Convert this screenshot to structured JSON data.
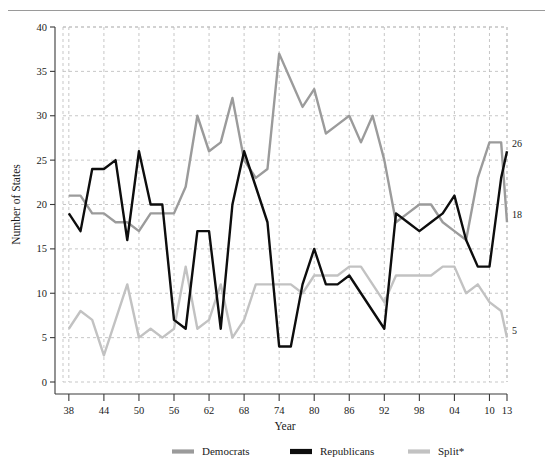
{
  "figure": {
    "has_top_rule": true,
    "background": "#ffffff"
  },
  "chart_data": {
    "type": "line",
    "title": "",
    "xlabel": "Year",
    "ylabel": "Number of States",
    "xlim": [
      37,
      113
    ],
    "ylim": [
      0,
      40
    ],
    "grid": true,
    "legend_position": "bottom",
    "ytick_labels": [
      "0",
      "5",
      "10",
      "15",
      "20",
      "25",
      "30",
      "35",
      "40"
    ],
    "ytick_values": [
      0,
      5,
      10,
      15,
      20,
      25,
      30,
      35,
      40
    ],
    "xtick_labels": [
      "38",
      "44",
      "50",
      "56",
      "62",
      "68",
      "74",
      "80",
      "86",
      "92",
      "98",
      "04",
      "10",
      "13"
    ],
    "xtick_values": [
      38,
      44,
      50,
      56,
      62,
      68,
      74,
      80,
      86,
      92,
      98,
      104,
      110,
      113
    ],
    "x": [
      38,
      40,
      42,
      44,
      46,
      48,
      50,
      52,
      54,
      56,
      58,
      60,
      62,
      64,
      66,
      68,
      70,
      72,
      74,
      76,
      78,
      80,
      82,
      84,
      86,
      88,
      90,
      92,
      94,
      96,
      98,
      100,
      102,
      104,
      106,
      108,
      110,
      112,
      113
    ],
    "series": [
      {
        "name": "Democrats",
        "color": "#9b9b9b",
        "values": [
          21,
          21,
          19,
          19,
          18,
          18,
          17,
          19,
          19,
          19,
          22,
          30,
          26,
          27,
          32,
          25,
          23,
          24,
          37,
          34,
          31,
          33,
          28,
          29,
          30,
          27,
          30,
          25,
          18,
          19,
          20,
          20,
          18,
          17,
          16,
          23,
          27,
          27,
          18
        ],
        "end_label": "18"
      },
      {
        "name": "Republicans",
        "color": "#0d0d0d",
        "values": [
          19,
          17,
          24,
          24,
          25,
          16,
          26,
          20,
          20,
          7,
          6,
          17,
          17,
          6,
          20,
          26,
          22,
          18,
          4,
          4,
          11,
          15,
          11,
          11,
          12,
          10,
          8,
          6,
          19,
          18,
          17,
          18,
          19,
          21,
          16,
          13,
          13,
          23,
          26
        ],
        "end_label": "26"
      },
      {
        "name": "Split*",
        "color": "#c2c2c2",
        "values": [
          6,
          8,
          7,
          3,
          7,
          11,
          5,
          6,
          5,
          6,
          13,
          6,
          7,
          11,
          5,
          7,
          11,
          11,
          11,
          11,
          10,
          12,
          12,
          12,
          13,
          13,
          11,
          9,
          12,
          12,
          12,
          12,
          13,
          13,
          10,
          11,
          9,
          8,
          5
        ],
        "end_label": "5"
      }
    ]
  },
  "legend": {
    "items": [
      {
        "label": "Democrats",
        "color": "#9b9b9b"
      },
      {
        "label": "Republicans",
        "color": "#0d0d0d"
      },
      {
        "label": "Split*",
        "color": "#c2c2c2"
      }
    ]
  }
}
